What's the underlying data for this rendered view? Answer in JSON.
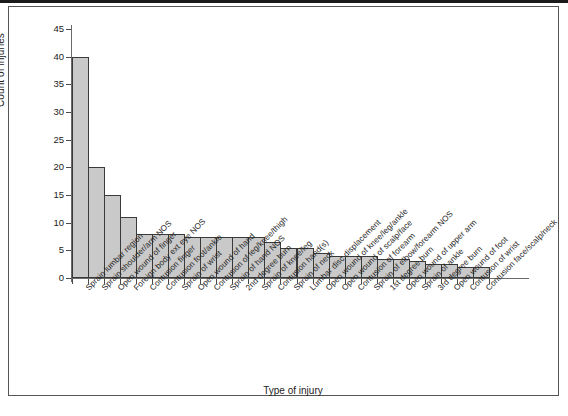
{
  "chart_data": {
    "type": "bar",
    "title": "",
    "xlabel": "Type of injury",
    "ylabel": "Count of injuries",
    "ylim": [
      0,
      46
    ],
    "yticks": [
      0,
      5,
      10,
      15,
      20,
      25,
      30,
      35,
      40,
      45
    ],
    "grid": false,
    "legend": null,
    "bar_color": "#c9c9c9",
    "bar_edge_color": "#3a3a3a",
    "categories": [
      "Sprain lumbar region",
      "Sprain shoulder/arm NOS",
      "Open wound of finger",
      "Foreign body ext eye NOS",
      "Contusion finger",
      "Contusion foot/ankle",
      "Sprain of wrist",
      "Open wound of hand",
      "Contusion of leg/knee/thigh",
      "Sprain of hand NOS",
      "2nd degree burn",
      "Sprain of knee/leg",
      "Contusion hand(s)",
      "Sprain of neck",
      "Lumbar disc displacement",
      "Open wound of knee/leg/ankle",
      "Open wound of scalp/face",
      "Contusion of forearm",
      "Sprain of elbow/forearm NOS",
      "1st degree burn",
      "Open wound of upper arm",
      "Sprain of ankle",
      "3rd degree burn",
      "Open wound of foot",
      "Contusion of wrist",
      "Contusion face/scalp/neck"
    ],
    "values": [
      40,
      20,
      15,
      11,
      8,
      8,
      8,
      7.5,
      7.5,
      7.5,
      7.5,
      7.5,
      6.5,
      5.5,
      5.5,
      4.5,
      4,
      4,
      4,
      3.5,
      3.5,
      3,
      2.5,
      2.5,
      2,
      2
    ]
  }
}
